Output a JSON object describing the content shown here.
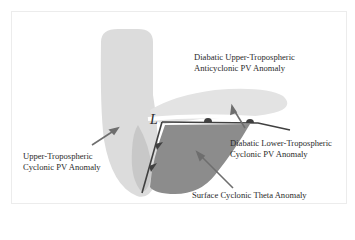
{
  "diagram": {
    "labels": {
      "upper_anticyclonic": [
        "Diabatic Upper-Tropospheric",
        "Anticyclonic PV Anomaly"
      ],
      "upper_cyclonic": [
        "Upper-Tropospheric",
        "Cyclonic PV Anomaly"
      ],
      "lower_cyclonic": [
        "Diabatic Lower-Tropospheric",
        "Cyclonic PV Anomaly"
      ],
      "surface_theta": "Surface Cyclonic Theta Anomaly",
      "low_center": "L"
    },
    "colors": {
      "upper_cyclonic_fill": "#dcdcdc",
      "upper_cyclonic_core": "#c6c6c6",
      "anticyclonic_fill": "#e3e3e3",
      "surface_theta_fill": "#8c8c8c",
      "front_line": "#404040",
      "arrow": "#6e6e6e",
      "text": "#2a2a2a"
    }
  }
}
